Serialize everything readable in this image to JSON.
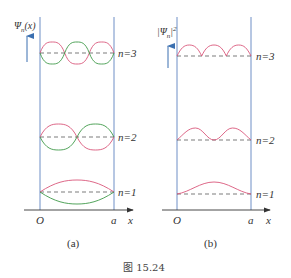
{
  "figure": {
    "caption": "图 15.24",
    "colors": {
      "wall": "#6f8fc6",
      "axis": "#333333",
      "baseline_dash": "#444444",
      "psi_positive": "#d9577a",
      "psi_negative": "#3f9a4a",
      "arrow": "#3a6fb0",
      "text": "#333333"
    },
    "panel_a": {
      "sublabel": "(a)",
      "y_axis_label": "Ψn(x)",
      "y_axis_label_main": "Ψ",
      "y_axis_label_sub": "n",
      "y_axis_label_arg": "(x)",
      "origin_label": "O",
      "wall_label": "a",
      "x_axis_label": "x",
      "levels": [
        {
          "n": 1,
          "label": "n=1",
          "half_waves": 1
        },
        {
          "n": 2,
          "label": "n=2",
          "half_waves": 2
        },
        {
          "n": 3,
          "label": "n=3",
          "half_waves": 3
        }
      ]
    },
    "panel_b": {
      "sublabel": "(b)",
      "y_axis_label": "|Ψn|²",
      "y_axis_label_main": "|Ψ",
      "y_axis_label_sub": "n",
      "y_axis_label_close": "|",
      "y_axis_label_sup": "2",
      "origin_label": "O",
      "wall_label": "a",
      "x_axis_label": "x",
      "levels": [
        {
          "n": 1,
          "label": "n=1",
          "humps": 1
        },
        {
          "n": 2,
          "label": "n=2",
          "humps": 2
        },
        {
          "n": 3,
          "label": "n=3",
          "humps": 3
        }
      ]
    }
  }
}
